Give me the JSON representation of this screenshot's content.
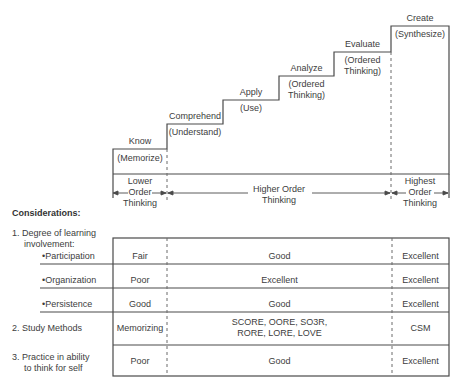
{
  "staircase": {
    "steps": [
      {
        "level": "Know",
        "description": "(Memorize)"
      },
      {
        "level": "Comprehend",
        "description": "(Understand)"
      },
      {
        "level": "Apply",
        "description": "(Use)"
      },
      {
        "level": "Analyze",
        "description": "(Ordered",
        "description2": "Thinking)"
      },
      {
        "level": "Evaluate",
        "description": "(Ordered",
        "description2": "Thinking)"
      },
      {
        "level": "Create",
        "description": "(Synthesize)"
      }
    ]
  },
  "ranges": [
    {
      "line1": "Lower",
      "line2": "Order",
      "line3": "Thinking"
    },
    {
      "line1": "Higher Order",
      "line2": "Thinking"
    },
    {
      "line1": "Highest",
      "line2": "Order",
      "line3": "Thinking"
    }
  ],
  "considerations": {
    "title": "Considerations:",
    "rows": [
      {
        "label": "1. Degree of learning",
        "label2": "involvement:"
      },
      {
        "label": "•Participation",
        "lower": "Fair",
        "higher": "Good",
        "highest": "Excellent"
      },
      {
        "label": "•Organization",
        "lower": "Poor",
        "higher": "Excellent",
        "highest": "Excellent"
      },
      {
        "label": "•Persistence",
        "lower": "Good",
        "higher": "Good",
        "highest": "Excellent"
      },
      {
        "label": "2. Study Methods",
        "lower": "Memorizing",
        "higher": "SCORE, OORE, SO3R,",
        "higher2": "RORE, LORE, LOVE",
        "highest": "CSM"
      },
      {
        "label": "3. Practice in ability",
        "label2": "to think for self",
        "lower": "Poor",
        "higher": "Good",
        "highest": "Excellent"
      }
    ]
  }
}
